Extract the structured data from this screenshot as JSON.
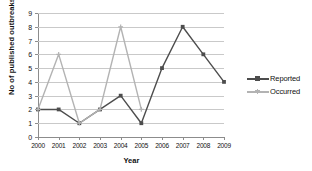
{
  "chart_data": {
    "type": "line",
    "title": "",
    "xlabel": "Year",
    "ylabel": "No of published outbreaks",
    "categories": [
      "2000",
      "2001",
      "2002",
      "2003",
      "2004",
      "2005",
      "2006",
      "2007",
      "2008",
      "2009"
    ],
    "x": [
      2000,
      2001,
      2002,
      2003,
      2004,
      2005,
      2006,
      2007,
      2008,
      2009
    ],
    "ylim": [
      0,
      9
    ],
    "xlim": [
      2000,
      2009
    ],
    "yticks": [
      "0",
      "1",
      "2",
      "3",
      "4",
      "5",
      "6",
      "7",
      "8",
      "9"
    ],
    "grid": true,
    "legend_position": "right",
    "series": [
      {
        "name": "Reported",
        "color": "#4d4d4d",
        "marker": "square",
        "values": [
          2,
          2,
          1,
          2,
          3,
          1,
          5,
          8,
          6,
          4
        ]
      },
      {
        "name": "Occurred",
        "color": "#b3b3b3",
        "marker": "cross",
        "values": [
          2,
          6,
          1,
          2,
          8,
          2,
          null,
          null,
          null,
          null
        ]
      }
    ]
  },
  "legend": {
    "items": [
      {
        "label": "Reported"
      },
      {
        "label": "Occurred"
      }
    ]
  },
  "colors": {
    "reported": "#4d4d4d",
    "occurred": "#b3b3b3",
    "grid": "#c9c9c9",
    "axis": "#8c8c8c",
    "text": "#111111"
  }
}
